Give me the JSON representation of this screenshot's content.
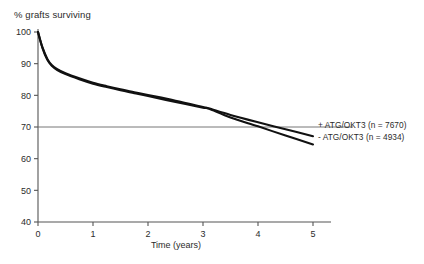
{
  "chart_data": {
    "type": "line",
    "title": "",
    "ylabel": "% grafts surviving",
    "xlabel": "Time (years)",
    "xlim": [
      0,
      5
    ],
    "ylim": [
      40,
      100
    ],
    "xticks": [
      0,
      1,
      2,
      3,
      4,
      5
    ],
    "xtick_labels": [
      "0",
      "1",
      "2",
      "3",
      "4",
      "5"
    ],
    "yticks": [
      40,
      50,
      60,
      70,
      80,
      90,
      100
    ],
    "ytick_labels": [
      "40",
      "50",
      "60",
      "70",
      "80",
      "90",
      "100"
    ],
    "grid": false,
    "reference_lines": [
      {
        "name": "70-percent-line",
        "orientation": "horizontal",
        "y": 70
      }
    ],
    "legend_position": "right-inside",
    "series": [
      {
        "name": "+ ATG/OKT3 (n = 7670)",
        "group": "+ ATG/OKT3",
        "n": 7670,
        "x": [
          0,
          0.08,
          0.17,
          0.25,
          0.35,
          0.5,
          0.75,
          1.0,
          1.25,
          1.5,
          1.75,
          2.0,
          2.5,
          3.0,
          3.1,
          3.5,
          4.0,
          4.5,
          5.0
        ],
        "values": [
          100,
          95.2,
          91.5,
          89.6,
          88.3,
          87.0,
          85.4,
          84.0,
          82.9,
          81.9,
          81.0,
          80.1,
          78.3,
          76.3,
          75.9,
          73.8,
          71.5,
          69.3,
          67.1
        ]
      },
      {
        "name": "- ATG/OKT3 (n = 4934)",
        "group": "- ATG/OKT3",
        "n": 4934,
        "x": [
          0,
          0.08,
          0.17,
          0.25,
          0.35,
          0.5,
          0.75,
          1.0,
          1.25,
          1.5,
          1.75,
          2.0,
          2.5,
          3.0,
          3.1,
          3.5,
          4.0,
          4.5,
          5.0
        ],
        "values": [
          100,
          95.0,
          91.2,
          89.3,
          88.0,
          86.7,
          85.1,
          83.7,
          82.6,
          81.6,
          80.7,
          79.8,
          77.9,
          76.1,
          75.8,
          73.0,
          70.2,
          67.3,
          64.5
        ]
      }
    ],
    "colors": {
      "curve": "#111111",
      "axis": "#555555",
      "text": "#2b2b2b",
      "reference_line": "#666666",
      "background": "#ffffff"
    }
  },
  "legend": {
    "items": [
      {
        "label": "+ ATG/OKT3 (n = 7670)"
      },
      {
        "label": "- ATG/OKT3 (n = 4934)"
      }
    ]
  }
}
